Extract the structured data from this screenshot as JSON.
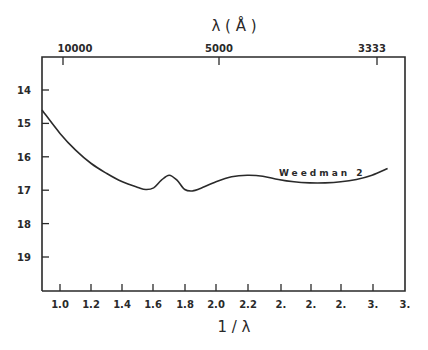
{
  "chart_data": {
    "type": "line",
    "title": "",
    "xlabel": "1/λ",
    "x2label": "λ (Å)",
    "ylabel": "",
    "xlim": [
      0.88,
      3.2
    ],
    "ylim": [
      13.0,
      20.0
    ],
    "y_inverted": true,
    "grid": false,
    "legend": "none",
    "x_ticks": [
      "1.0",
      "1.2",
      "1.4",
      "1.6",
      "1.8",
      "2.0",
      "2.2",
      "2.",
      "2.",
      "2.",
      "3.",
      "3."
    ],
    "x_tick_values": [
      1.0,
      1.2,
      1.4,
      1.6,
      1.8,
      2.0,
      2.2,
      2.4,
      2.6,
      2.8,
      3.0,
      3.2
    ],
    "x2_ticks": [
      "10000",
      "5000",
      "3333"
    ],
    "x2_tick_values": [
      1.0,
      2.0,
      3.0
    ],
    "y_ticks": [
      "14",
      "15",
      "16",
      "17",
      "18",
      "19"
    ],
    "series": [
      {
        "name": "Weedman 2",
        "x": [
          0.88,
          1.0,
          1.1,
          1.2,
          1.3,
          1.4,
          1.5,
          1.55,
          1.6,
          1.65,
          1.7,
          1.75,
          1.8,
          1.85,
          1.9,
          2.0,
          2.1,
          2.2,
          2.3,
          2.4,
          2.5,
          2.6,
          2.7,
          2.8,
          2.9,
          3.0,
          3.1
        ],
        "values": [
          14.6,
          15.3,
          15.8,
          16.2,
          16.5,
          16.75,
          16.92,
          16.98,
          16.93,
          16.7,
          16.55,
          16.7,
          16.98,
          17.02,
          16.95,
          16.75,
          16.6,
          16.55,
          16.58,
          16.68,
          16.75,
          16.78,
          16.78,
          16.75,
          16.68,
          16.55,
          16.35
        ]
      }
    ],
    "annotations": [
      {
        "text": "Weedman 2",
        "x": 2.35,
        "y": 16.3
      }
    ]
  },
  "labels": {
    "top_axis_title": "λ ( Å )",
    "bottom_axis_title": "1 / λ",
    "series_label": "Weedman 2"
  }
}
